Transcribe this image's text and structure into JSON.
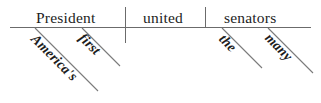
{
  "diagram": {
    "type": "reed-kellogg-sentence-diagram",
    "sentence": "America's first President united the many senators",
    "baseline": {
      "subject": "President",
      "verb": "united",
      "object": "senators"
    },
    "modifiers": {
      "americas": "America's",
      "first": "first",
      "the": "the",
      "many": "many"
    },
    "colors": {
      "text": "#1d1d1d",
      "line": "#6b6b6b",
      "background": "#ffffff"
    }
  }
}
